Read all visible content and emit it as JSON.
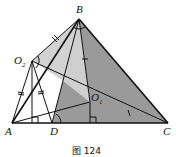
{
  "figure": {
    "caption": "图 124",
    "points": {
      "A": {
        "label": "A",
        "x": 12,
        "y": 123
      },
      "B": {
        "label": "B",
        "x": 79,
        "y": 19
      },
      "C": {
        "label": "C",
        "x": 168,
        "y": 123
      },
      "D": {
        "label": "D",
        "x": 52,
        "y": 123
      },
      "O1": {
        "label": "O",
        "sub": "1",
        "x": 90,
        "y": 102
      },
      "O2": {
        "label": "O",
        "sub": "2",
        "x": 32,
        "y": 61
      }
    },
    "colors": {
      "dark_fill": "#9a9a9a",
      "light_fill": "#d2d2d2",
      "stroke": "#111111"
    }
  }
}
